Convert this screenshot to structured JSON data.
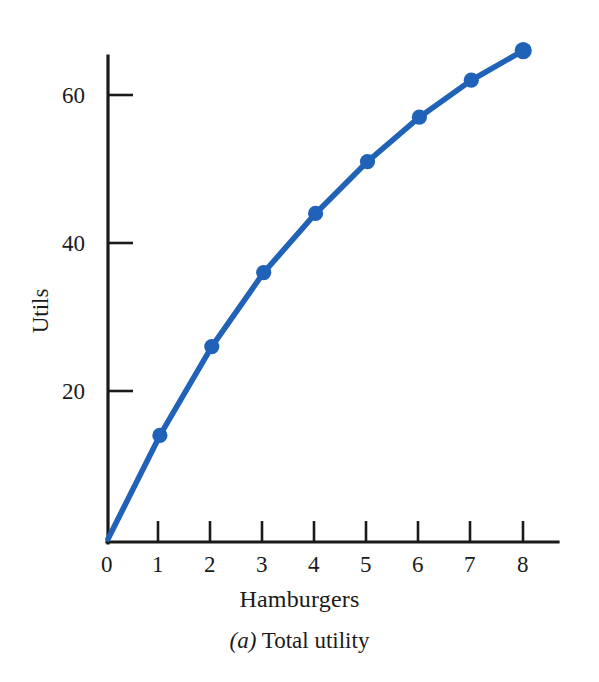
{
  "figure": {
    "caption_prefix": "(a)",
    "caption_text": " Total utility",
    "background_color": "#ffffff",
    "ink_color": "#1a1a1a",
    "series_color": "#1f62b8"
  },
  "chart_data": {
    "type": "line",
    "title": "(a) Total utility",
    "xlabel": "Hamburgers",
    "ylabel": "Utils",
    "x": [
      0,
      1,
      2,
      3,
      4,
      5,
      6,
      7,
      8
    ],
    "values": [
      0,
      14,
      26,
      36,
      44,
      51,
      57,
      62,
      66
    ],
    "series": [
      {
        "name": "Total utility",
        "values": [
          0,
          14,
          26,
          36,
          44,
          51,
          57,
          62,
          66
        ]
      }
    ],
    "xlim": [
      0,
      8.65
    ],
    "ylim": [
      0,
      70
    ],
    "xticks": [
      0,
      1,
      2,
      3,
      4,
      5,
      6,
      7,
      8
    ],
    "xtick_labels": [
      "0",
      "1",
      "2",
      "3",
      "4",
      "5",
      "6",
      "7",
      "8"
    ],
    "yticks": [
      20,
      40,
      60
    ],
    "ytick_labels": [
      "20",
      "40",
      "60"
    ],
    "grid": false,
    "legend": "none",
    "markers": "filled-circle",
    "marker_color": "#1f62b8",
    "line_color": "#1f62b8",
    "line_width": 5
  },
  "axes": {
    "x_tick_labels": [
      "0",
      "1",
      "2",
      "3",
      "4",
      "5",
      "6",
      "7",
      "8"
    ],
    "y_tick_labels": [
      "20",
      "40",
      "60"
    ],
    "x_title": "Hamburgers",
    "y_title": "Utils"
  },
  "points": [
    {
      "label": "1 hamburger",
      "x": 1,
      "y": 14
    },
    {
      "label": "2 hamburgers",
      "x": 2,
      "y": 26
    },
    {
      "label": "3 hamburgers",
      "x": 3,
      "y": 36
    },
    {
      "label": "4 hamburgers",
      "x": 4,
      "y": 44
    },
    {
      "label": "5 hamburgers",
      "x": 5,
      "y": 51
    },
    {
      "label": "6 hamburgers",
      "x": 6,
      "y": 57
    },
    {
      "label": "7 hamburgers",
      "x": 7,
      "y": 62
    },
    {
      "label": "8 hamburgers",
      "x": 8,
      "y": 66
    }
  ]
}
